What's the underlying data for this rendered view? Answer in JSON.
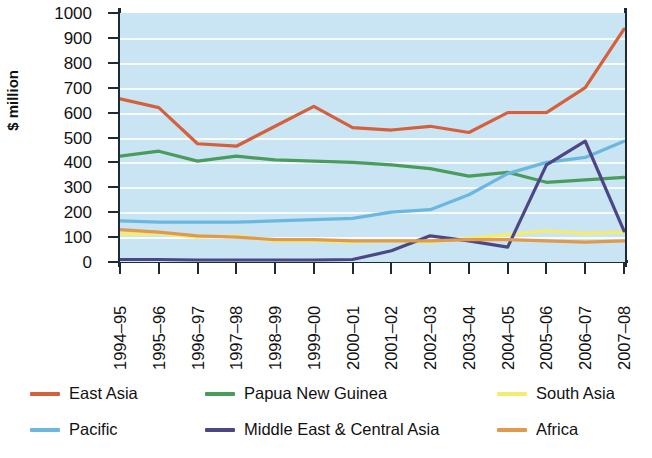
{
  "chart_data": {
    "type": "line",
    "title": "",
    "xlabel": "",
    "ylabel": "$ million",
    "ylim": [
      0,
      1000
    ],
    "ytick_step": 100,
    "grid": "horizontal",
    "legend_position": "bottom",
    "background_color": "#c9e4f2",
    "gridline_color": "#ffffff",
    "axis_color": "#1c2b36",
    "categories": [
      "1994–95",
      "1995–96",
      "1996–97",
      "1997–98",
      "1998–99",
      "1999–00",
      "2000–01",
      "2001–02",
      "2002–03",
      "2003–04",
      "2004–05",
      "2005–06",
      "2006–07",
      "2007–08"
    ],
    "ytick_labels": [
      "1000",
      "900",
      "800",
      "700",
      "600",
      "500",
      "400",
      "300",
      "200",
      "100",
      "0"
    ],
    "series": [
      {
        "name": "East Asia",
        "color": "#d4603c",
        "values": [
          655,
          620,
          475,
          465,
          545,
          625,
          540,
          530,
          545,
          520,
          600,
          600,
          700,
          935
        ]
      },
      {
        "name": "Papua New Guinea",
        "color": "#4a9c5d",
        "values": [
          425,
          445,
          405,
          425,
          410,
          405,
          400,
          390,
          375,
          345,
          360,
          320,
          330,
          340
        ]
      },
      {
        "name": "South Asia",
        "color": "#f5ec6e",
        "values": [
          110,
          115,
          100,
          105,
          85,
          85,
          80,
          85,
          80,
          95,
          110,
          125,
          115,
          120
        ]
      },
      {
        "name": "Pacific",
        "color": "#6cb7e0",
        "values": [
          165,
          160,
          160,
          160,
          165,
          170,
          175,
          200,
          210,
          270,
          355,
          400,
          420,
          485
        ]
      },
      {
        "name": "Middle East  & Central Asia",
        "color": "#4c4687",
        "values": [
          10,
          10,
          8,
          8,
          8,
          8,
          10,
          45,
          105,
          85,
          60,
          390,
          485,
          125
        ]
      },
      {
        "name": "Africa",
        "color": "#e09a4e",
        "values": [
          130,
          120,
          105,
          100,
          90,
          90,
          85,
          85,
          85,
          90,
          90,
          85,
          80,
          85
        ]
      }
    ]
  },
  "legend": {
    "items": [
      {
        "label": "East Asia",
        "color": "#d4603c"
      },
      {
        "label": "Papua New Guinea",
        "color": "#4a9c5d"
      },
      {
        "label": "South Asia",
        "color": "#f5ec6e"
      },
      {
        "label": "Pacific",
        "color": "#6cb7e0"
      },
      {
        "label": "Middle East  & Central Asia",
        "color": "#4c4687"
      },
      {
        "label": "Africa",
        "color": "#e09a4e"
      }
    ]
  }
}
